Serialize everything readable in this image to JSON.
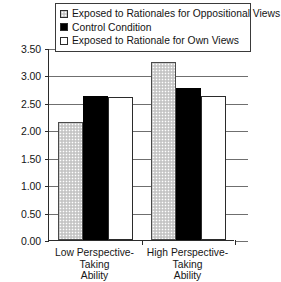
{
  "chart_data": {
    "type": "bar",
    "title": "",
    "xlabel": "",
    "ylabel": "",
    "ylim": [
      0.0,
      3.5
    ],
    "ytick_labels": [
      "3.50",
      "3.00",
      "2.50",
      "2.00",
      "1.50",
      "1.00",
      "0.50",
      "0.00"
    ],
    "ytick_values": [
      3.5,
      3.0,
      2.5,
      2.0,
      1.5,
      1.0,
      0.5,
      0.0
    ],
    "grid": true,
    "legend_position": "top",
    "categories": [
      "Low Perspective-Taking Ability",
      "High Perspective-Taking Ability"
    ],
    "category_lines": [
      [
        "Low Perspective-Taking",
        "Ability"
      ],
      [
        "High Perspective-Taking",
        "Ability"
      ]
    ],
    "series": [
      {
        "name": "Exposed to Rationales for Oppositional Views",
        "style": "series-stipple",
        "swatch_color": "#d2d2d2",
        "values": [
          2.15,
          3.25
        ]
      },
      {
        "name": "Control Condition",
        "style": "series-solid",
        "swatch_color": "#000000",
        "values": [
          2.62,
          2.78
        ]
      },
      {
        "name": "Exposed to Rationale for Own Views",
        "style": "series-white",
        "swatch_color": "#ffffff",
        "values": [
          2.6,
          2.62
        ]
      }
    ]
  }
}
